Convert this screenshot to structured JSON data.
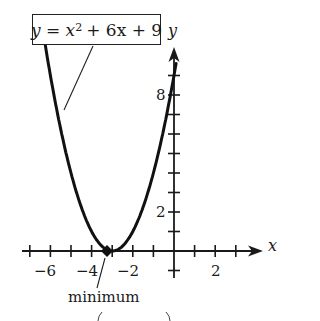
{
  "chart_data": {
    "type": "line",
    "title": "",
    "equation": "y = x^2 + 6x + 9",
    "equation_parts": {
      "lhs": "y",
      "x": "x",
      "exp": "2",
      "rest": "+ 6x + 9"
    },
    "xlabel": "x",
    "ylabel": "y",
    "xlim": [
      -7,
      3.5
    ],
    "ylim": [
      -1,
      9.5
    ],
    "x_ticks": [
      -7,
      -6,
      -5,
      -4,
      -3,
      -2,
      -1,
      1,
      2,
      3
    ],
    "x_tick_labels": [
      "-6",
      "-4",
      "-2",
      "2"
    ],
    "y_ticks": [
      -1,
      1,
      2,
      3,
      4,
      5,
      6,
      7,
      8,
      9
    ],
    "y_tick_labels": [
      "2",
      "8"
    ],
    "grid": false,
    "series": [
      {
        "name": "y = x^2 + 6x + 9",
        "x": [
          -6.3,
          -6,
          -5.5,
          -5,
          -4.5,
          -4,
          -3.5,
          -3,
          -2.5,
          -2,
          -1.5,
          -1,
          -0.5,
          0,
          0.1
        ],
        "y": [
          10.89,
          9,
          6.25,
          4,
          2.25,
          1,
          0.25,
          0,
          0.25,
          1,
          2.25,
          4,
          6.25,
          9,
          9.61
        ]
      }
    ],
    "annotations": [
      {
        "text": "minimum",
        "x": -3,
        "y": 0,
        "type": "point"
      },
      {
        "text": "y = x^2 + 6x + 9",
        "type": "callout-box"
      }
    ]
  },
  "labels": {
    "x_axis": "x",
    "y_axis": "y",
    "minimum": "minimum",
    "x_tick_neg6": "−6",
    "x_tick_neg4": "−4",
    "x_tick_neg2": "−2",
    "x_tick_2": "2",
    "y_tick_2": "2",
    "y_tick_8": "8"
  },
  "colors": {
    "ink": "#1a1a1a",
    "background": "#ffffff"
  }
}
